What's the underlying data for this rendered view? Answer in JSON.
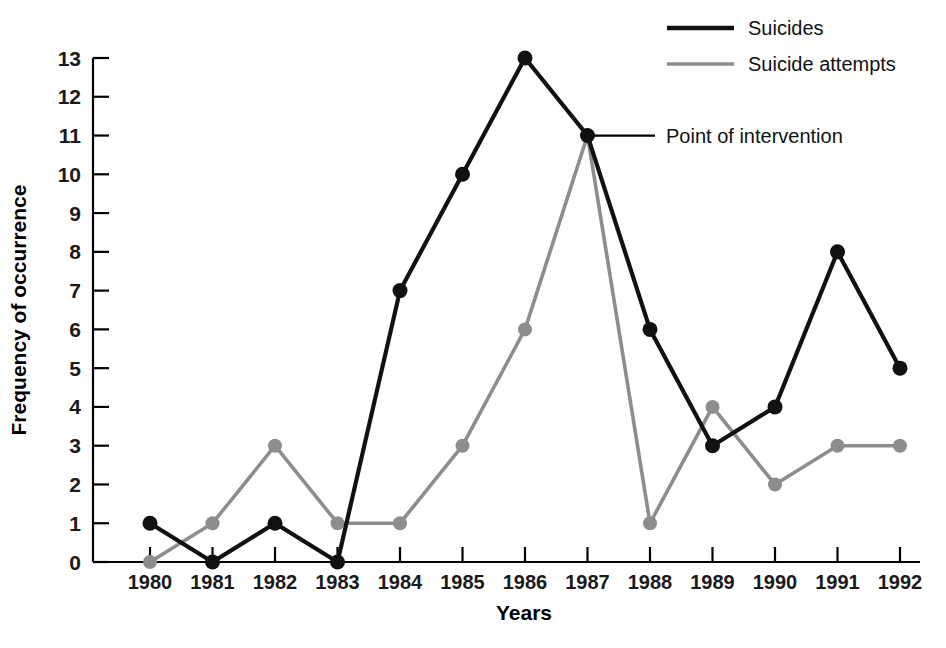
{
  "chart_data": {
    "type": "line",
    "title": "",
    "xlabel": "Years",
    "ylabel": "Frequency of occurrence",
    "categories": [
      "1980",
      "1981",
      "1982",
      "1983",
      "1984",
      "1985",
      "1986",
      "1987",
      "1988",
      "1989",
      "1990",
      "1991",
      "1992"
    ],
    "x": [
      1980,
      1981,
      1982,
      1983,
      1984,
      1985,
      1986,
      1987,
      1988,
      1989,
      1990,
      1991,
      1992
    ],
    "xlim": [
      1980,
      1992
    ],
    "ylim": [
      0,
      13
    ],
    "yticks": [
      0,
      1,
      2,
      3,
      4,
      5,
      6,
      7,
      8,
      9,
      10,
      11,
      12,
      13
    ],
    "ytick_labels": [
      "0",
      "1",
      "2",
      "3",
      "4",
      "5",
      "6",
      "7",
      "8",
      "9",
      "10",
      "11",
      "12",
      "13"
    ],
    "grid": false,
    "legend_position": "top-right",
    "series": [
      {
        "name": "Suicides",
        "color": "#111111",
        "marker": "circle",
        "values": [
          1,
          0,
          1,
          0,
          7,
          10,
          13,
          11,
          6,
          3,
          4,
          8,
          5
        ]
      },
      {
        "name": "Suicide attempts",
        "color": "#8d8d8d",
        "marker": "circle",
        "values": [
          0,
          1,
          3,
          1,
          1,
          3,
          6,
          11,
          1,
          4,
          2,
          3,
          3
        ]
      }
    ],
    "annotations": [
      {
        "text": "Point of intervention",
        "target_x": 1987,
        "target_y": 11
      }
    ]
  },
  "legend": {
    "items": [
      {
        "label": "Suicides",
        "color": "#111111"
      },
      {
        "label": "Suicide attempts",
        "color": "#8d8d8d"
      }
    ]
  },
  "annotation": {
    "text": "Point of intervention"
  },
  "axes": {
    "x_title": "Years",
    "y_title": "Frequency of occurrence"
  },
  "colors": {
    "primary_series": "#111111",
    "secondary_series": "#8d8d8d",
    "axis": "#000000",
    "background": "#ffffff"
  }
}
